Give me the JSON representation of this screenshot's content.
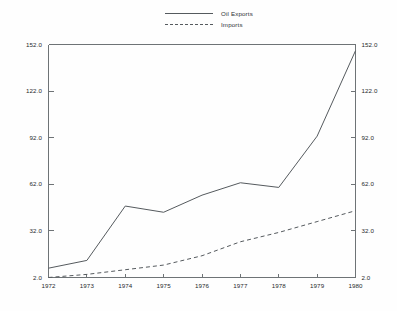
{
  "chart_data": {
    "type": "line",
    "title": "",
    "subtitle": "",
    "xlabel": "",
    "ylabel": "",
    "x": [
      1972,
      1973,
      1974,
      1975,
      1976,
      1977,
      1978,
      1979,
      1980
    ],
    "categories": [
      "1972",
      "1973",
      "1974",
      "1975",
      "1976",
      "1977",
      "1978",
      "1979",
      "1980"
    ],
    "series": [
      {
        "name": "Oil Exports",
        "style": "solid",
        "color": "#555a5e",
        "values": [
          8,
          13,
          48,
          44,
          55,
          63,
          60,
          93,
          148
        ]
      },
      {
        "name": "Imports",
        "style": "dashed",
        "color": "#555a5e",
        "values": [
          2,
          4,
          7,
          10,
          16,
          25,
          31,
          38,
          45
        ]
      }
    ],
    "ylim": [
      2.0,
      152.0
    ],
    "xlim": [
      1972,
      1980
    ],
    "y_ticks": [
      2.0,
      32.0,
      62.0,
      92.0,
      122.0,
      152.0
    ],
    "y_tick_labels": [
      "2.0",
      "32.0",
      "62.0",
      "92.0",
      "122.0",
      "152.0"
    ],
    "y_ticks_right": [
      2.0,
      32.0,
      62.0,
      92.0,
      122.0,
      152.0
    ],
    "y_tick_labels_right": [
      "2.0",
      "32.0",
      "62.0",
      "92.0",
      "122.0",
      "152.0"
    ],
    "x_tick_labels": [
      "1972",
      "1973",
      "1974",
      "1975",
      "1976",
      "1977",
      "1978",
      "1979",
      "1980"
    ],
    "grid": false,
    "legend_position": "top-center",
    "dual_axis": true,
    "background_color": "#fefefe",
    "axis_color": "#6e7376"
  },
  "legend": {
    "entries": [
      {
        "label": "Oil Exports",
        "style": "solid"
      },
      {
        "label": "Imports",
        "style": "dashed"
      }
    ]
  }
}
